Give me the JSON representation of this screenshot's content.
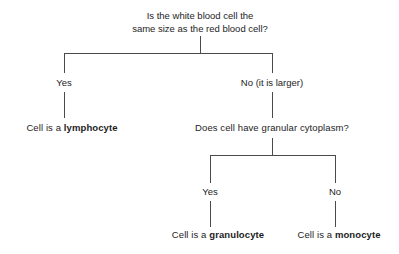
{
  "diagram": {
    "type": "decision-tree",
    "root_question": {
      "line1": "Is the white blood cell the",
      "line2": "same size as the red blood cell?"
    },
    "branches": {
      "left_label": "Yes",
      "right_label": "No (it is larger)",
      "sub_left_label": "Yes",
      "sub_right_label": "No"
    },
    "sub_question": "Does cell have granular cytoplasm?",
    "outcomes": {
      "lymphocyte": {
        "prefix": "Cell is a ",
        "term": "lymphocyte"
      },
      "granulocyte": {
        "prefix": "Cell is a ",
        "term": "granulocyte"
      },
      "monocyte": {
        "prefix": "Cell is a ",
        "term": "monocyte"
      }
    },
    "colors": {
      "background": "#ffffff",
      "text": "#1d1d1d",
      "line": "#4a4a4a"
    }
  }
}
